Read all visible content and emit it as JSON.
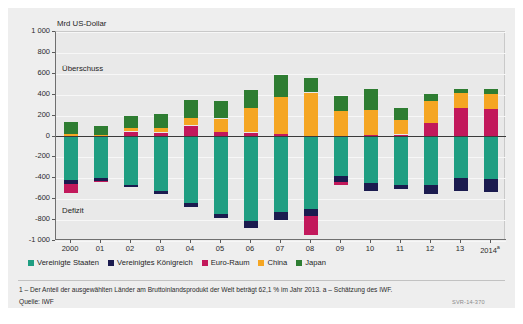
{
  "figure": {
    "axis_unit": "Mrd US-Dollar",
    "note_surplus": "Überschuss",
    "note_deficit": "Defizit",
    "footnote": "1 – Der Anteil der ausgewählten Länder am Bruttoinlandsprodukt der Welt beträgt 62,1 % im Jahr 2013.   a – Schätzung des IWF.",
    "source": "Quelle: IWF",
    "code": "SVR-14-370"
  },
  "chart_data": {
    "type": "bar",
    "subtype": "stacked-diverging",
    "title": "",
    "xlabel": "",
    "ylabel": "Mrd US-Dollar",
    "ylim": [
      -1000,
      1000
    ],
    "yticks": [
      1000,
      800,
      600,
      400,
      200,
      0,
      -200,
      -400,
      -600,
      -800,
      -1000
    ],
    "ytick_labels": [
      "1 000",
      "800",
      "600",
      "400",
      "200",
      "0",
      "-200",
      "-400",
      "-600",
      "-800",
      "-1 000"
    ],
    "grid": true,
    "legend_position": "bottom",
    "categories": [
      "2000",
      "01",
      "02",
      "03",
      "04",
      "05",
      "06",
      "07",
      "08",
      "09",
      "10",
      "11",
      "12",
      "13",
      "2014"
    ],
    "category_labels": [
      "2000",
      "01",
      "02",
      "03",
      "04",
      "05",
      "06",
      "07",
      "08",
      "09",
      "10",
      "11",
      "12",
      "13",
      "2014a"
    ],
    "series": [
      {
        "name": "Vereinigte Staaten",
        "color": "#1f9e82",
        "values": [
          -417,
          -395,
          -459,
          -521,
          -634,
          -745,
          -807,
          -719,
          -690,
          -381,
          -444,
          -459,
          -461,
          -400,
          -410
        ]
      },
      {
        "name": "Vereinigtes Königreich",
        "color": "#1b1b4f",
        "values": [
          -38,
          -32,
          -28,
          -27,
          -45,
          -36,
          -74,
          -79,
          -72,
          -58,
          -75,
          -44,
          -93,
          -121,
          -118
        ]
      },
      {
        "name": "Euro-Raum",
        "color": "#c2185b",
        "values": [
          -85,
          -8,
          48,
          38,
          105,
          40,
          38,
          27,
          -186,
          -21,
          14,
          19,
          129,
          271,
          259
        ]
      },
      {
        "name": "China",
        "color": "#f5a623",
        "values": [
          21,
          17,
          35,
          46,
          69,
          132,
          232,
          353,
          421,
          243,
          238,
          136,
          215,
          148,
          150
        ]
      },
      {
        "name": "Japan",
        "color": "#2e7d32",
        "values": [
          120,
          88,
          112,
          136,
          172,
          165,
          171,
          212,
          142,
          146,
          204,
          119,
          59,
          34,
          45
        ]
      }
    ]
  }
}
